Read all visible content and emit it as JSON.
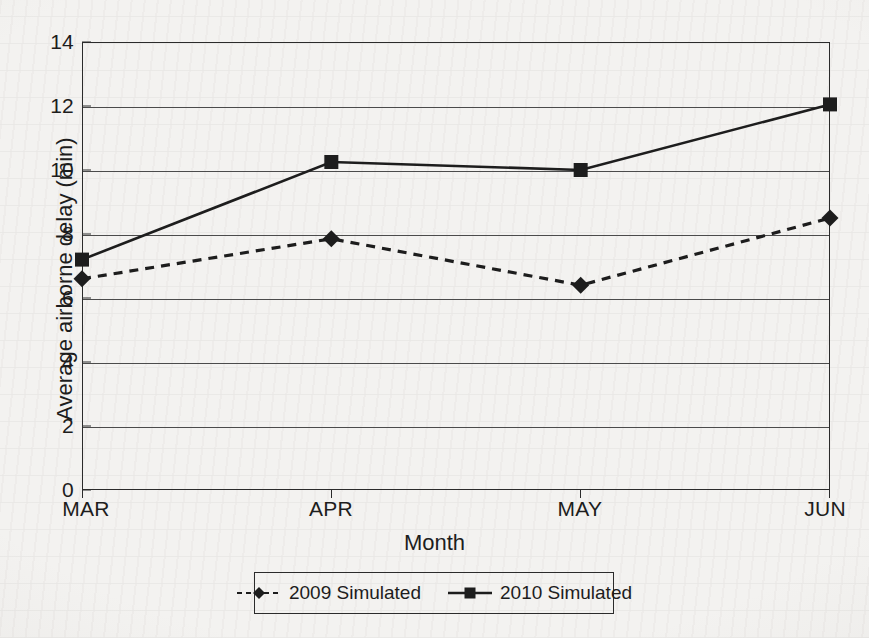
{
  "chart_data": {
    "type": "line",
    "title": "",
    "xlabel": "Month",
    "ylabel": "Average airborne delay (min)",
    "categories": [
      "MAR",
      "APR",
      "MAY",
      "JUN"
    ],
    "x": [
      "MAR",
      "APR",
      "MAY",
      "JUN"
    ],
    "ylim": [
      0,
      14
    ],
    "yticks": [
      0,
      2,
      4,
      6,
      8,
      10,
      12,
      14
    ],
    "ytick_labels": [
      "0",
      "2",
      "4",
      "6",
      "8",
      "10",
      "12",
      "14"
    ],
    "grid": "horizontal",
    "legend_position": "below-axes",
    "series": [
      {
        "name": "2009 Simulated",
        "values": [
          6.6,
          7.85,
          6.4,
          8.5
        ],
        "marker": "diamond",
        "line_style": "dashed",
        "color": "#1d1d1d"
      },
      {
        "name": "2010 Simulated",
        "values": [
          7.2,
          10.25,
          10.0,
          12.05
        ],
        "marker": "square",
        "line_style": "solid",
        "color": "#1d1d1d"
      }
    ]
  },
  "axes": {
    "y_title": "Average airborne delay (min)",
    "x_title": "Month",
    "y_tick_labels": [
      "14",
      "12",
      "10",
      "8",
      "6",
      "4",
      "2",
      "0"
    ],
    "x_tick_labels": [
      "MAR",
      "APR",
      "MAY",
      "JUN"
    ]
  },
  "legend": {
    "entries": [
      {
        "label": "2009 Simulated",
        "marker": "diamond",
        "line_style": "dashed"
      },
      {
        "label": "2010 Simulated",
        "marker": "square",
        "line_style": "solid"
      }
    ]
  },
  "colors": {
    "ink": "#1d1d1d",
    "frame": "#2b2b2b",
    "grid": "#4b4b4b",
    "page": "#f3f2f0"
  }
}
